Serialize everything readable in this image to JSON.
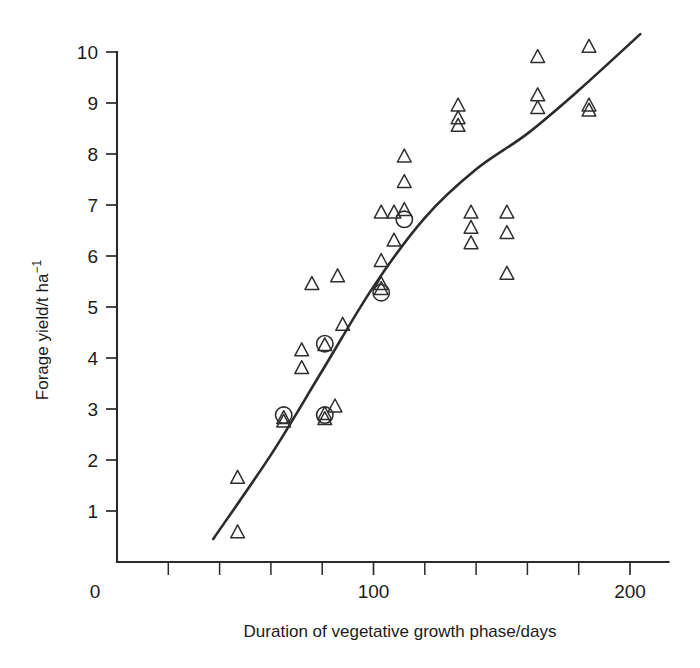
{
  "chart_data": {
    "type": "scatter",
    "title": "",
    "xlabel": "Duration of vegetative growth phase/days",
    "ylabel": "Forage yield/t ha⁻¹",
    "ylabel_main": "Forage yield/t ha",
    "ylabel_exponent": "−1",
    "xlim": [
      0,
      215
    ],
    "ylim": [
      0,
      10.2
    ],
    "xticks": [
      0,
      100,
      200
    ],
    "xtick_labels": [
      "0",
      "100",
      "200"
    ],
    "xticks_minor": [
      20,
      40,
      60,
      80,
      120,
      140,
      160,
      180
    ],
    "yticks": [
      1,
      2,
      3,
      4,
      5,
      6,
      7,
      8,
      9,
      10
    ],
    "ytick_labels": [
      "1",
      "2",
      "3",
      "4",
      "5",
      "6",
      "7",
      "8",
      "9",
      "10"
    ],
    "grid": false,
    "legend": "none",
    "marker_colour": "#2f2f2f",
    "line_colour": "#2b2b2b",
    "series": [
      {
        "name": "triangle-markers",
        "marker": "triangle-open",
        "points": [
          [
            47,
            1.65
          ],
          [
            47,
            0.58
          ],
          [
            65,
            2.82
          ],
          [
            65,
            2.75
          ],
          [
            81,
            4.25
          ],
          [
            81,
            2.9
          ],
          [
            81,
            2.8
          ],
          [
            85,
            3.05
          ],
          [
            72,
            4.15
          ],
          [
            72,
            3.8
          ],
          [
            76,
            5.45
          ],
          [
            86,
            5.6
          ],
          [
            88,
            4.65
          ],
          [
            103,
            6.85
          ],
          [
            103,
            5.9
          ],
          [
            103,
            5.45
          ],
          [
            103,
            5.35
          ],
          [
            108,
            6.85
          ],
          [
            108,
            6.3
          ],
          [
            112,
            6.9
          ],
          [
            112,
            7.45
          ],
          [
            112,
            7.95
          ],
          [
            133,
            8.95
          ],
          [
            133,
            8.7
          ],
          [
            133,
            8.55
          ],
          [
            138,
            6.85
          ],
          [
            138,
            6.55
          ],
          [
            138,
            6.25
          ],
          [
            152,
            6.85
          ],
          [
            152,
            6.45
          ],
          [
            152,
            5.65
          ],
          [
            164,
            9.9
          ],
          [
            164,
            9.15
          ],
          [
            164,
            8.9
          ],
          [
            184,
            10.1
          ],
          [
            184,
            8.95
          ],
          [
            184,
            8.85
          ]
        ]
      },
      {
        "name": "circle-markers",
        "marker": "circle-open",
        "points": [
          [
            65,
            2.88
          ],
          [
            81,
            4.28
          ],
          [
            81,
            2.88
          ],
          [
            103,
            5.28
          ],
          [
            112,
            6.72
          ]
        ]
      }
    ],
    "fit_line": {
      "name": "fitted-curve",
      "points": [
        [
          37.5,
          0.45
        ],
        [
          60,
          2.1
        ],
        [
          80,
          3.75
        ],
        [
          100,
          5.4
        ],
        [
          120,
          6.75
        ],
        [
          140,
          7.7
        ],
        [
          160,
          8.4
        ],
        [
          180,
          9.25
        ],
        [
          204,
          10.35
        ]
      ]
    }
  },
  "axes": {
    "x_axis_name": "x-axis",
    "y_axis_name": "y-axis"
  }
}
